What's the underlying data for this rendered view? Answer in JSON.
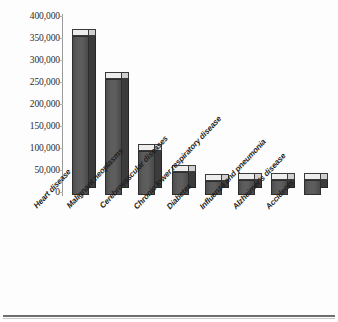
{
  "chart_data": {
    "type": "bar",
    "title": "",
    "subtitle": "",
    "xlabel": "",
    "ylabel": "",
    "ylim": [
      0,
      400000
    ],
    "grid": false,
    "legend": null,
    "style": "3d-column",
    "categories": [
      "Heart disease",
      "Malignant neoplasms",
      "Cerebrovascular diseases",
      "Chronic lower respiratory disease",
      "Diabetes",
      "Influenza and pneumonia",
      "Alzheimer's disease",
      "Accidents"
    ],
    "values": [
      355000,
      260000,
      98000,
      52000,
      32000,
      34000,
      34000,
      33000
    ],
    "ytick_labels": [
      "400,000",
      "350,000",
      "300,000",
      "250,000",
      "200,000",
      "150,000",
      "100,000",
      "50,000",
      "0"
    ],
    "ytick_values": [
      400000,
      350000,
      300000,
      250000,
      200000,
      150000,
      100000,
      50000,
      0
    ],
    "colors": {
      "bar_front": "#585858",
      "bar_side": "#3b3b3b",
      "bar_top": "#ededed",
      "axis": "#9a9a9a",
      "text": "#1f1f1f",
      "background": "#fdfdfd",
      "rule": "#6e6e6e"
    }
  }
}
